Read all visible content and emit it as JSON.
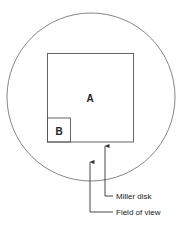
{
  "diagram": {
    "regions": {
      "large_square_label": "A",
      "small_square_label": "B"
    },
    "callouts": [
      {
        "label": "Miller disk",
        "target": "square"
      },
      {
        "label": "Field of view",
        "target": "circle"
      }
    ],
    "colors": {
      "stroke": "#555555",
      "text": "#222222",
      "background": "#ffffff"
    }
  }
}
